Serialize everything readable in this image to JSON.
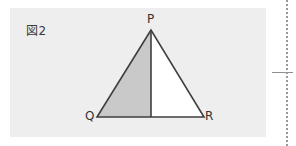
{
  "figure": {
    "label": "図2",
    "caption_id": "2",
    "background_color": "#eeeeee",
    "page_background": "#ffffff"
  },
  "diagram": {
    "type": "triangle-with-median",
    "stroke_color": "#3f3f3f",
    "shaded_fill": "#c9c9c9",
    "unshaded_fill": "#ffffff",
    "vertices": [
      {
        "name": "P",
        "label": "P",
        "x": 151,
        "y": 30
      },
      {
        "name": "Q",
        "label": "Q",
        "x": 97,
        "y": 117
      },
      {
        "name": "R",
        "label": "R",
        "x": 204,
        "y": 117
      }
    ],
    "median": {
      "from": "P",
      "to_midpoint_of": "QR",
      "midpoint": {
        "x": 151,
        "y": 117
      }
    },
    "regions": [
      {
        "name": "left-region-PQM",
        "fill": "#c9c9c9",
        "shaded": true
      },
      {
        "name": "right-region-PMR",
        "fill": "#ffffff",
        "shaded": false
      }
    ]
  },
  "page_marks": {
    "dotted_edge_color": "#9a9a9a",
    "tick_color": "#8e8e8e"
  }
}
